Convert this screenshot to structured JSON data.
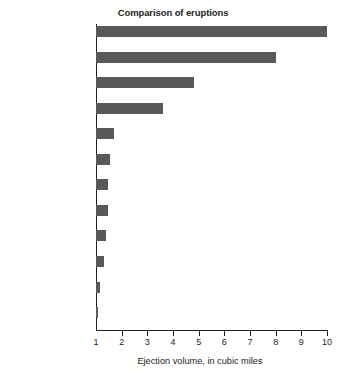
{
  "chart_data": {
    "type": "bar",
    "orientation": "horizontal",
    "title": "Comparison of eruptions",
    "xlabel": "Ejection volume, in cubic miles",
    "ylabel": "",
    "xlim": [
      1,
      10
    ],
    "xticks": [
      1,
      2,
      3,
      4,
      5,
      6,
      7,
      8,
      9,
      10
    ],
    "xtick_labels": [
      "1",
      "2",
      "3",
      "4",
      "5",
      "6",
      "7",
      "8",
      "9",
      "10"
    ],
    "grid": false,
    "legend": false,
    "bar_color": "#595959",
    "axis_color": "#231f20",
    "categories": [
      "Mount Mazama,\nOregon 5000 BC",
      "Tambora,\nIndonesia 1815",
      "Krakatau,\nIndonesia 1883",
      "Mount Katmai,\nAlaska 1912",
      "Mount St. Helens\n1900 BC",
      "Vesuvius,\nItaly AD 79",
      "Mount St. Helens\n1480–82",
      "Fuji,\nJapan 1707",
      "Mount Pinatubo,\n1991",
      "Mount St. Helens\n1842–57",
      "Mount St. Helens\n1980",
      "El Chichón,\nMexico 1982"
    ],
    "values": [
      10.0,
      8.0,
      4.8,
      3.6,
      1.7,
      1.55,
      1.48,
      1.45,
      1.4,
      1.3,
      1.15,
      1.08
    ],
    "bars": [
      {
        "label_line1": "Mount Mazama,",
        "label_line2": "Oregon 5000 BC",
        "value": 10.0
      },
      {
        "label_line1": "Tambora,",
        "label_line2": "Indonesia 1815",
        "value": 8.0
      },
      {
        "label_line1": "Krakatau,",
        "label_line2": "Indonesia 1883",
        "value": 4.8
      },
      {
        "label_line1": "Mount Katmai,",
        "label_line2": "Alaska 1912",
        "value": 3.6
      },
      {
        "label_line1": "Mount St. Helens",
        "label_line2": "1900 BC",
        "value": 1.7
      },
      {
        "label_line1": "Vesuvius,",
        "label_line2": "Italy AD 79",
        "value": 1.55
      },
      {
        "label_line1": "Mount St. Helens",
        "label_line2": "1480–82",
        "value": 1.48
      },
      {
        "label_line1": "Fuji,",
        "label_line2": "Japan 1707",
        "value": 1.45
      },
      {
        "label_line1": "Mount Pinatubo,",
        "label_line2": "1991",
        "value": 1.4
      },
      {
        "label_line1": "Mount St. Helens",
        "label_line2": "1842–57",
        "value": 1.3
      },
      {
        "label_line1": "Mount St. Helens",
        "label_line2": "1980",
        "value": 1.15
      },
      {
        "label_line1": "El Chichón,",
        "label_line2": "Mexico 1982",
        "value": 1.08
      }
    ]
  }
}
